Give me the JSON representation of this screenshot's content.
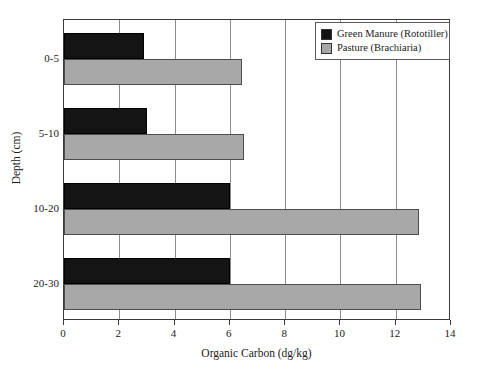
{
  "chart_data": {
    "type": "bar",
    "orientation": "horizontal",
    "title": "",
    "xlabel": "Organic Carbon (dg/kg)",
    "ylabel": "Depth (cm)",
    "categories": [
      "0-5",
      "5-10",
      "10-20",
      "20-30"
    ],
    "xlim": [
      0,
      14
    ],
    "xticks": [
      0,
      2,
      4,
      6,
      8,
      10,
      12,
      14
    ],
    "xticklabels": [
      "0",
      "2",
      "4",
      "6",
      "8",
      "10",
      "12",
      "14"
    ],
    "grid": "vertical",
    "legend_position": "upper right",
    "series": [
      {
        "name": "Green Manure (Rototiller)",
        "color": "#141414",
        "values": [
          2.9,
          3.0,
          6.0,
          6.0
        ]
      },
      {
        "name": "Pasture (Brachiaria)",
        "color": "#a8a8a8",
        "values": [
          6.45,
          6.5,
          12.85,
          12.9
        ]
      }
    ]
  },
  "legend": {
    "entries": [
      {
        "label": "Green Manure (Rototiller)"
      },
      {
        "label": "Pasture (Brachiaria)"
      }
    ]
  },
  "colors": {
    "series_0": "#141414",
    "series_1": "#a8a8a8",
    "axis": "#3a3a3a",
    "grid": "#8c8c8c",
    "background": "#ffffff"
  }
}
